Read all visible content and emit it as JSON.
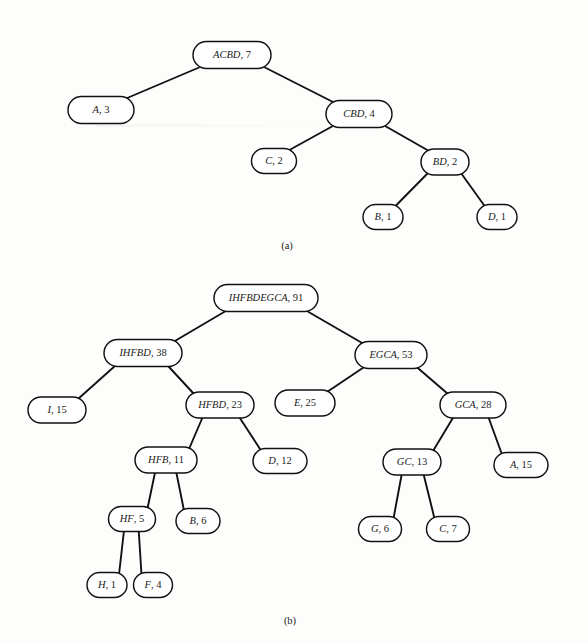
{
  "figure": {
    "background_color": "#fdfdfc",
    "ink_color": "#111111",
    "node_fill": "#ffffff",
    "caption_a": "(a)",
    "caption_b": "(b)"
  },
  "chart_data": {
    "type": "diagram",
    "diagram_kind": "huffman-tree",
    "title": "",
    "panels": [
      {
        "id": "a",
        "caption": "(a)",
        "caption_pos": {
          "x": 287,
          "y": 249
        },
        "nodes": [
          {
            "id": "a-root",
            "symbols": "ACBD",
            "weight": 7,
            "label": "ACBD, 7",
            "x": 232,
            "y": 55,
            "w": 78,
            "h": 27
          },
          {
            "id": "a-A",
            "symbols": "A",
            "weight": 3,
            "label": "A, 3",
            "x": 101,
            "y": 110,
            "w": 66,
            "h": 27
          },
          {
            "id": "a-CBD",
            "symbols": "CBD",
            "weight": 4,
            "label": "CBD, 4",
            "x": 359,
            "y": 114,
            "w": 66,
            "h": 27
          },
          {
            "id": "a-C",
            "symbols": "C",
            "weight": 2,
            "label": "C, 2",
            "x": 274,
            "y": 161,
            "w": 45,
            "h": 25
          },
          {
            "id": "a-BD",
            "symbols": "BD",
            "weight": 2,
            "label": "BD, 2",
            "x": 445,
            "y": 162,
            "w": 48,
            "h": 26
          },
          {
            "id": "a-B",
            "symbols": "B",
            "weight": 1,
            "label": "B, 1",
            "x": 383,
            "y": 217,
            "w": 40,
            "h": 25
          },
          {
            "id": "a-D",
            "symbols": "D",
            "weight": 1,
            "label": "D, 1",
            "x": 497,
            "y": 217,
            "w": 40,
            "h": 25
          }
        ],
        "edges": [
          {
            "from": "a-root",
            "to": "a-A"
          },
          {
            "from": "a-root",
            "to": "a-CBD"
          },
          {
            "from": "a-CBD",
            "to": "a-C"
          },
          {
            "from": "a-CBD",
            "to": "a-BD"
          },
          {
            "from": "a-BD",
            "to": "a-B"
          },
          {
            "from": "a-BD",
            "to": "a-D"
          }
        ]
      },
      {
        "id": "b",
        "caption": "(b)",
        "caption_pos": {
          "x": 290,
          "y": 624
        },
        "nodes": [
          {
            "id": "b-root",
            "symbols": "IHFBDEGCA",
            "weight": 91,
            "label": "IHFBDEGCA, 91",
            "x": 266,
            "y": 298,
            "w": 104,
            "h": 27
          },
          {
            "id": "b-IHFBD",
            "symbols": "IHFBD",
            "weight": 38,
            "label": "IHFBD, 38",
            "x": 143,
            "y": 353,
            "w": 78,
            "h": 27
          },
          {
            "id": "b-EGCA",
            "symbols": "EGCA",
            "weight": 53,
            "label": "EGCA, 53",
            "x": 391,
            "y": 355,
            "w": 72,
            "h": 27
          },
          {
            "id": "b-I",
            "symbols": "I",
            "weight": 15,
            "label": "I, 15",
            "x": 57,
            "y": 410,
            "w": 58,
            "h": 26
          },
          {
            "id": "b-HFBD",
            "symbols": "HFBD",
            "weight": 23,
            "label": "HFBD, 23",
            "x": 220,
            "y": 405,
            "w": 68,
            "h": 26
          },
          {
            "id": "b-E",
            "symbols": "E",
            "weight": 25,
            "label": "E, 25",
            "x": 305,
            "y": 403,
            "w": 60,
            "h": 26
          },
          {
            "id": "b-GCA",
            "symbols": "GCA",
            "weight": 28,
            "label": "GCA, 28",
            "x": 473,
            "y": 405,
            "w": 66,
            "h": 26
          },
          {
            "id": "b-HFB",
            "symbols": "HFB",
            "weight": 11,
            "label": "HFB, 11",
            "x": 166,
            "y": 460,
            "w": 62,
            "h": 26
          },
          {
            "id": "b-D",
            "symbols": "D",
            "weight": 12,
            "label": "D, 12",
            "x": 280,
            "y": 461,
            "w": 54,
            "h": 25
          },
          {
            "id": "b-GC",
            "symbols": "GC",
            "weight": 13,
            "label": "GC, 13",
            "x": 412,
            "y": 462,
            "w": 58,
            "h": 26
          },
          {
            "id": "b-A",
            "symbols": "A",
            "weight": 15,
            "label": "A, 15",
            "x": 521,
            "y": 465,
            "w": 54,
            "h": 25
          },
          {
            "id": "b-HF",
            "symbols": "HF",
            "weight": 5,
            "label": "HF, 5",
            "x": 132,
            "y": 519,
            "w": 47,
            "h": 25
          },
          {
            "id": "b-B",
            "symbols": "B",
            "weight": 6,
            "label": "B, 6",
            "x": 198,
            "y": 521,
            "w": 44,
            "h": 25
          },
          {
            "id": "b-G",
            "symbols": "G",
            "weight": 6,
            "label": "G, 6",
            "x": 380,
            "y": 529,
            "w": 43,
            "h": 25
          },
          {
            "id": "b-C",
            "symbols": "C",
            "weight": 7,
            "label": "C, 7",
            "x": 448,
            "y": 529,
            "w": 43,
            "h": 25
          },
          {
            "id": "b-H",
            "symbols": "H",
            "weight": 1,
            "label": "H, 1",
            "x": 107,
            "y": 585,
            "w": 40,
            "h": 25
          },
          {
            "id": "b-F",
            "symbols": "F",
            "weight": 4,
            "label": "F, 4",
            "x": 153,
            "y": 585,
            "w": 39,
            "h": 25
          }
        ],
        "edges": [
          {
            "from": "b-root",
            "to": "b-IHFBD"
          },
          {
            "from": "b-root",
            "to": "b-EGCA"
          },
          {
            "from": "b-IHFBD",
            "to": "b-I"
          },
          {
            "from": "b-IHFBD",
            "to": "b-HFBD"
          },
          {
            "from": "b-EGCA",
            "to": "b-E"
          },
          {
            "from": "b-EGCA",
            "to": "b-GCA"
          },
          {
            "from": "b-HFBD",
            "to": "b-HFB"
          },
          {
            "from": "b-HFBD",
            "to": "b-D"
          },
          {
            "from": "b-GCA",
            "to": "b-GC"
          },
          {
            "from": "b-GCA",
            "to": "b-A"
          },
          {
            "from": "b-HFB",
            "to": "b-HF"
          },
          {
            "from": "b-HFB",
            "to": "b-B"
          },
          {
            "from": "b-GC",
            "to": "b-G"
          },
          {
            "from": "b-GC",
            "to": "b-C"
          },
          {
            "from": "b-HF",
            "to": "b-H"
          },
          {
            "from": "b-HF",
            "to": "b-F"
          }
        ]
      }
    ]
  }
}
